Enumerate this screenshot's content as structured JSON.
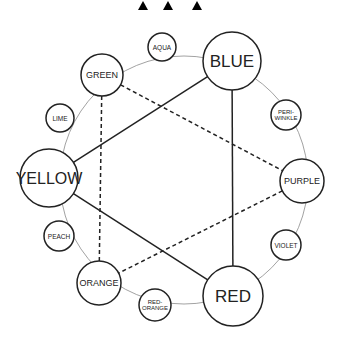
{
  "header": {
    "markers": [
      {
        "name": "triangle-1",
        "x": 143
      },
      {
        "name": "triangle-2",
        "x": 170
      },
      {
        "name": "triangle-3",
        "x": 197
      }
    ]
  },
  "wheel": {
    "center": [
      184,
      180
    ],
    "radius": 124,
    "ring_color": "#8a8a8a"
  },
  "colors": {
    "stroke": "#222222",
    "background": "#ffffff"
  },
  "nodes": {
    "blue": {
      "label": "BLUE",
      "x": 232,
      "y": 61,
      "r": 29,
      "size": 17,
      "tier": "primary"
    },
    "red": {
      "label": "RED",
      "x": 233,
      "y": 296,
      "r": 30,
      "size": 17,
      "tier": "primary"
    },
    "yellow": {
      "label": "YELLOW",
      "x": 49,
      "y": 178,
      "r": 29,
      "size": 16,
      "tier": "primary"
    },
    "green": {
      "label": "GREEN",
      "x": 102,
      "y": 75,
      "r": 21,
      "size": 9,
      "tier": "secondary"
    },
    "purple": {
      "label": "PURPLE",
      "x": 302,
      "y": 181,
      "r": 22,
      "size": 9,
      "tier": "secondary"
    },
    "orange": {
      "label": "ORANGE",
      "x": 99,
      "y": 283,
      "r": 22,
      "size": 9,
      "tier": "secondary"
    },
    "aqua": {
      "label": "AQUA",
      "x": 162,
      "y": 47,
      "r": 14,
      "size": 6.5,
      "tier": "tertiary"
    },
    "periwinkle": {
      "label_lines": [
        "PERI-",
        "WINKLE"
      ],
      "x": 286,
      "y": 115,
      "r": 15,
      "size": 6,
      "tier": "tertiary"
    },
    "violet": {
      "label": "VIOLET",
      "x": 286,
      "y": 245,
      "r": 15,
      "size": 6.5,
      "tier": "tertiary"
    },
    "red_orange": {
      "label_lines": [
        "RED-",
        "ORANGE"
      ],
      "x": 155,
      "y": 305,
      "r": 16,
      "size": 6,
      "tier": "tertiary"
    },
    "peach": {
      "label": "PEACH",
      "x": 59,
      "y": 236,
      "r": 15,
      "size": 6.5,
      "tier": "tertiary"
    },
    "lime": {
      "label": "LIME",
      "x": 60,
      "y": 118,
      "r": 14,
      "size": 6.5,
      "tier": "tertiary"
    }
  },
  "edges": {
    "solid": [
      [
        "yellow",
        "blue"
      ],
      [
        "blue",
        "red"
      ],
      [
        "red",
        "yellow"
      ]
    ],
    "dashed": [
      [
        "green",
        "purple"
      ],
      [
        "purple",
        "orange"
      ],
      [
        "orange",
        "green"
      ]
    ]
  }
}
